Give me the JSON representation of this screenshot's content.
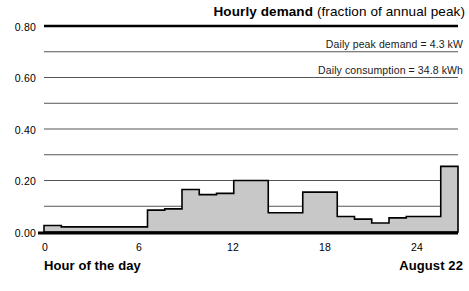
{
  "chart_data": {
    "type": "bar",
    "title_bold": "Hourly demand",
    "title_rest": " (fraction of annual peak)",
    "title": "Hourly demand (fraction of annual peak)",
    "subtitle": "",
    "xlabel": "Hour of the day",
    "ylabel": "",
    "date_label": "August 22",
    "annotations": [
      "Daily peak demand = 4.3 kW",
      "Daily consumption = 34.8 kWh"
    ],
    "grid": true,
    "legend_position": "none",
    "xlim": [
      0,
      24
    ],
    "ylim": [
      0.0,
      0.8
    ],
    "ytick_labels": [
      "0.80",
      "0.60",
      "0.40",
      "0.20",
      "0.00"
    ],
    "ytick_values": [
      0.8,
      0.6,
      0.4,
      0.2,
      0.0
    ],
    "yminor_values": [
      0.7,
      0.5,
      0.3,
      0.1
    ],
    "xtick_labels": [
      "0",
      "6",
      "12",
      "18",
      "24"
    ],
    "xtick_values": [
      0,
      6,
      12,
      18,
      24
    ],
    "categories": [
      "0",
      "1",
      "2",
      "3",
      "4",
      "5",
      "6",
      "7",
      "8",
      "9",
      "10",
      "11",
      "12",
      "13",
      "14",
      "15",
      "16",
      "17",
      "18",
      "19",
      "20",
      "21",
      "22",
      "23"
    ],
    "values": [
      0.025,
      0.02,
      0.02,
      0.02,
      0.02,
      0.02,
      0.085,
      0.09,
      0.165,
      0.145,
      0.15,
      0.2,
      0.2,
      0.075,
      0.075,
      0.155,
      0.155,
      0.06,
      0.05,
      0.035,
      0.055,
      0.06,
      0.06,
      0.255
    ],
    "series_note": "stepped hourly demand profile",
    "bar_fill": "#c8c8c8",
    "bar_edge": "#000000",
    "grid_color": "#555555",
    "axis_color": "#000000"
  },
  "axes": {
    "y_ticks": [
      {
        "label": "0.80",
        "value": 0.8
      },
      {
        "label": "0.60",
        "value": 0.6
      },
      {
        "label": "0.40",
        "value": 0.4
      },
      {
        "label": "0.20",
        "value": 0.2
      },
      {
        "label": "0.00",
        "value": 0.0
      }
    ],
    "x_ticks": [
      {
        "label": "0",
        "value": 0
      },
      {
        "label": "6",
        "value": 6
      },
      {
        "label": "12",
        "value": 12
      },
      {
        "label": "18",
        "value": 18
      },
      {
        "label": "24",
        "value": 24
      }
    ]
  },
  "profile": {
    "hours": [
      0,
      1,
      2,
      3,
      4,
      5,
      6,
      7,
      8,
      9,
      10,
      11,
      12,
      13,
      14,
      15,
      16,
      17,
      18,
      19,
      20,
      21,
      22,
      23
    ],
    "demand": [
      0.025,
      0.02,
      0.02,
      0.02,
      0.02,
      0.02,
      0.085,
      0.09,
      0.165,
      0.145,
      0.15,
      0.2,
      0.2,
      0.075,
      0.075,
      0.155,
      0.155,
      0.06,
      0.05,
      0.035,
      0.055,
      0.06,
      0.06,
      0.255
    ]
  }
}
